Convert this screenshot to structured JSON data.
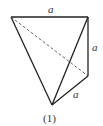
{
  "figure": {
    "caption": "(1)",
    "edge_labels": {
      "top": "a",
      "right": "a",
      "bottom_right": "a"
    },
    "vertices": {
      "top_left": [
        11,
        17
      ],
      "top_right": [
        88,
        17
      ],
      "right": [
        88,
        76
      ],
      "bottom": [
        52,
        105
      ]
    },
    "solid_edges": [
      [
        "top_left",
        "top_right"
      ],
      [
        "top_right",
        "right"
      ],
      [
        "right",
        "bottom"
      ],
      [
        "top_left",
        "bottom"
      ],
      [
        "top_right",
        "bottom"
      ]
    ],
    "dashed_edges": [
      [
        "top_left",
        "right"
      ]
    ],
    "stroke_color": "#222222"
  }
}
